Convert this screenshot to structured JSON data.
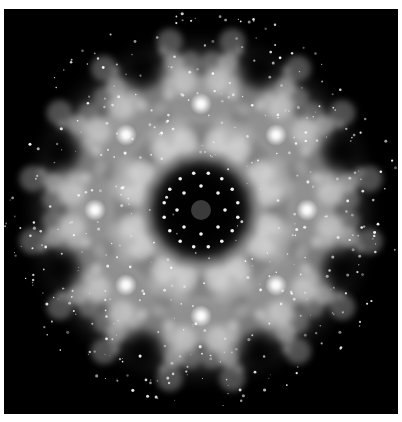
{
  "image": {
    "alt": "Black-and-white radially symmetric fractal kaleidoscope pattern on black background",
    "symmetry": 8,
    "colors": {
      "background": "#000000",
      "page": "#ffffff",
      "glow": "#f2f2f2",
      "mid": "#8a8a8a",
      "dark": "#1a1a1a"
    },
    "center": [
      197,
      201
    ],
    "rings": {
      "bright_spots_radius": 106,
      "inner_dots_radius": 30,
      "outer_radius": 185
    }
  }
}
